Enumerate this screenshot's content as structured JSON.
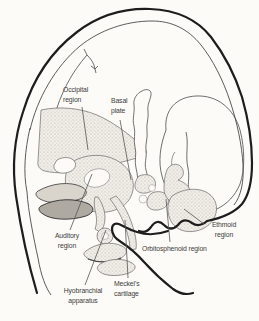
{
  "diagram": {
    "paper_color": "#fcfbf8",
    "ink_color": "#1d1d1d",
    "label_color": "#3c3c3c",
    "stipple_color": "#8c8c8c",
    "labels": {
      "occipital_region": "Occipital\nregion",
      "basal_plate": "Basal\nplate",
      "auditory_region": "Auditory\nregion",
      "hyobranchial_apparatus": "Hyobranchial\napparatus",
      "meckels_cartilage": "Meckel's\ncartilage",
      "orbitosphenoid_region": "Orbitosphenoid region",
      "ethmoid_region": "Ethmoid\nregion"
    }
  }
}
